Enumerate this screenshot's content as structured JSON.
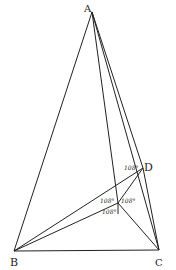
{
  "diagram": {
    "points": {
      "A": {
        "label": "A",
        "x": 92,
        "y": 12
      },
      "B": {
        "label": "B",
        "x": 14,
        "y": 251
      },
      "C": {
        "label": "C",
        "x": 159,
        "y": 250
      },
      "D": {
        "label": "D",
        "x": 143,
        "y": 168
      },
      "Y": {
        "label": "Y",
        "x": 118,
        "y": 203
      }
    },
    "angles": {
      "at_D": "108°",
      "at_Y_left": "108°",
      "at_Y_right": "108°",
      "at_Y_below": "108°"
    },
    "colors": {
      "line": "#222222",
      "background": "#ffffff"
    }
  }
}
